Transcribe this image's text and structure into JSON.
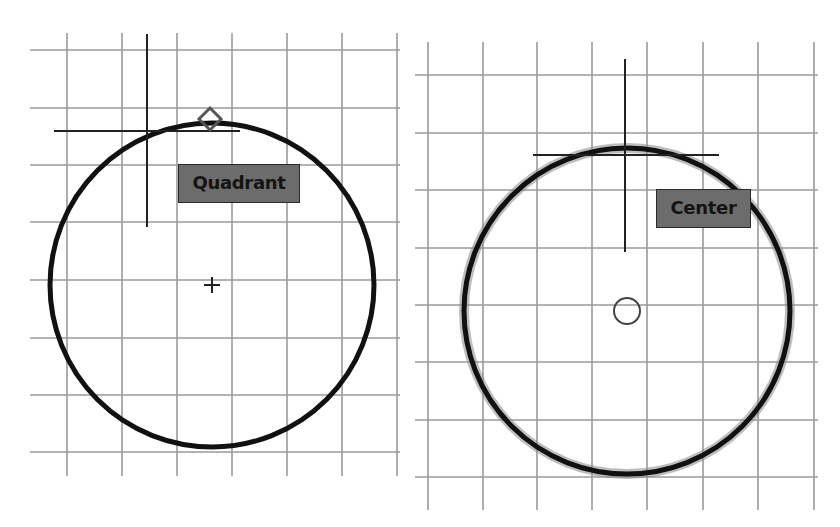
{
  "panels": [
    {
      "id": "quadrant",
      "snap_label": "Quadrant",
      "snap_marker": "diamond-icon",
      "grid": {
        "x": [
          67,
          122,
          177,
          232,
          287,
          342,
          397
        ],
        "y": [
          50,
          108,
          165,
          222,
          280,
          338,
          395,
          452
        ],
        "x_range": [
          30,
          400
        ],
        "y_range": [
          33,
          476
        ]
      },
      "circle": {
        "cx": 212,
        "cy": 285,
        "r": 162
      },
      "center_mark": "plus-icon",
      "crosshair": {
        "x": 147,
        "y": 131,
        "v_range": [
          34,
          227
        ],
        "h_range": [
          54,
          240
        ]
      },
      "marker_position": {
        "x": 210,
        "y": 119
      },
      "label_box": {
        "x": 178,
        "y": 164,
        "w": 122,
        "h": 39
      }
    },
    {
      "id": "center",
      "snap_label": "Center",
      "snap_marker": "circle-icon",
      "grid": {
        "x": [
          18,
          73,
          127,
          182,
          237,
          293,
          348,
          404
        ],
        "y": [
          75,
          133,
          190,
          248,
          305,
          362,
          420,
          477
        ],
        "x_range": [
          5,
          408
        ],
        "y_range": [
          42,
          510
        ]
      },
      "circle": {
        "cx": 217,
        "cy": 311,
        "r": 163
      },
      "center_mark": "circle-icon",
      "crosshair": {
        "x": 215,
        "y": 155,
        "v_range": [
          59,
          252
        ],
        "h_range": [
          123,
          309
        ]
      },
      "marker_position": {
        "x": 217,
        "y": 311
      },
      "label_box": {
        "x": 246,
        "y": 189,
        "w": 95,
        "h": 39
      }
    }
  ],
  "colors": {
    "grid": "#9a9a9a",
    "circle": "#111111",
    "crosshair": "#222222",
    "label_fill": "#6c6c6c",
    "label_text": "#141414",
    "marker": "#555555"
  }
}
